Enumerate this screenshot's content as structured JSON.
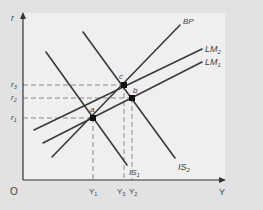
{
  "diagram": {
    "type": "IS-LM-BP diagram",
    "colors": {
      "background": "#e2e2e2",
      "panel": "#efefef",
      "curve": "#3a3a3a",
      "dashed": "#8a8a8a",
      "point": "#111111",
      "text": "#444444"
    },
    "axes": {
      "y_label": "r",
      "x_label": "Y",
      "origin_label": "O"
    },
    "curves": [
      {
        "id": "BP",
        "label": "BP"
      },
      {
        "id": "LM2",
        "label": "LM",
        "subscript": "2"
      },
      {
        "id": "LM1",
        "label": "LM",
        "subscript": "1"
      },
      {
        "id": "IS1",
        "label": "IS",
        "subscript": "1"
      },
      {
        "id": "IS2",
        "label": "IS",
        "subscript": "2"
      }
    ],
    "points": [
      {
        "id": "a",
        "label": "a"
      },
      {
        "id": "b",
        "label": "b"
      },
      {
        "id": "c",
        "label": "c"
      }
    ],
    "y_ticks": [
      {
        "id": "r3",
        "label": "r",
        "subscript": "3"
      },
      {
        "id": "r2",
        "label": "r",
        "subscript": "2"
      },
      {
        "id": "r1",
        "label": "r",
        "subscript": "1"
      }
    ],
    "x_ticks": [
      {
        "id": "Y1",
        "label": "Y",
        "subscript": "1"
      },
      {
        "id": "Y3",
        "label": "Y",
        "subscript": "3"
      },
      {
        "id": "Y2",
        "label": "Y",
        "subscript": "2"
      }
    ]
  }
}
